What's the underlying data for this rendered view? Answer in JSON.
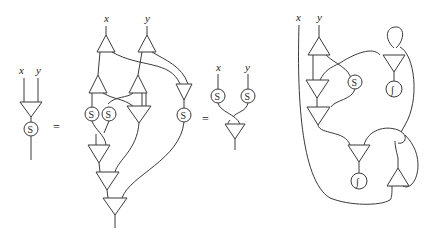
{
  "figure": {
    "stroke_color": "#3a3a3a",
    "background": "#ffffff"
  },
  "panel_a": {
    "inputs": [
      "x",
      "y"
    ],
    "node_label": "S"
  },
  "equals_1": "=",
  "panel_b": {
    "inputs": [
      "x",
      "y"
    ],
    "node_labels": [
      "S",
      "S",
      "S"
    ]
  },
  "equals_2": "=",
  "panel_c": {
    "inputs": [
      "x",
      "y"
    ],
    "node_labels": [
      "S",
      "S"
    ]
  },
  "panel_d": {
    "inputs": [
      "x",
      "y"
    ],
    "node_labels": [
      "S",
      "∫",
      "∫"
    ]
  }
}
